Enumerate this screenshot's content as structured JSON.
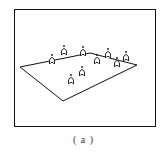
{
  "figure": {
    "caption": "( a )",
    "plane_polygon": [
      [
        20,
        67
      ],
      [
        90,
        53
      ],
      [
        137,
        65
      ],
      [
        63,
        101
      ]
    ],
    "figures": [
      {
        "x": 52,
        "y": 64
      },
      {
        "x": 64,
        "y": 55
      },
      {
        "x": 83,
        "y": 56
      },
      {
        "x": 97,
        "y": 64
      },
      {
        "x": 108,
        "y": 58
      },
      {
        "x": 117,
        "y": 67
      },
      {
        "x": 126,
        "y": 61
      },
      {
        "x": 71,
        "y": 84
      },
      {
        "x": 82,
        "y": 76
      }
    ],
    "colors": {
      "stroke": "#111111",
      "background": "#ffffff"
    }
  }
}
